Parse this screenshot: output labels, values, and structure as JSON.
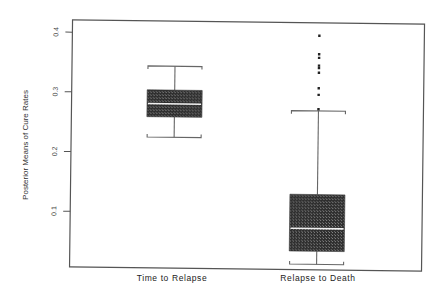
{
  "chart_data": {
    "type": "boxplot",
    "title": "",
    "xlabel": "",
    "ylabel": "Posterior Means of Cure Rates",
    "ylim": [
      0.0,
      0.42
    ],
    "yticks": [
      0.1,
      0.2,
      0.3,
      0.4
    ],
    "ytick_labels": [
      "0.1",
      "0.2",
      "0.3",
      "0.4"
    ],
    "grid": false,
    "legend": null,
    "categories": [
      "Time to Relapse",
      "Relapse to Death"
    ],
    "boxes": [
      {
        "name": "Time to Relapse",
        "whisker_low": 0.226,
        "q1": 0.26,
        "median": 0.282,
        "q3": 0.305,
        "whisker_high": 0.345,
        "outliers": []
      },
      {
        "name": "Relapse to Death",
        "whisker_low": 0.016,
        "q1": 0.038,
        "median": 0.076,
        "q3": 0.133,
        "whisker_high": 0.273,
        "outliers": [
          0.276,
          0.3,
          0.311,
          0.337,
          0.345,
          0.349,
          0.362,
          0.368,
          0.399
        ]
      }
    ]
  }
}
